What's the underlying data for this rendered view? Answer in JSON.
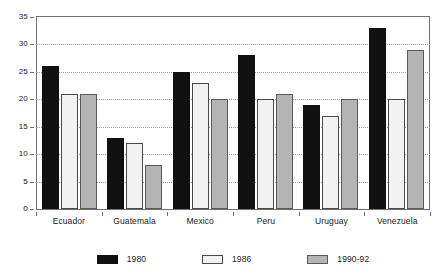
{
  "chart_data": {
    "type": "bar",
    "title": "",
    "subtitle": "",
    "xlabel": "",
    "ylabel": "",
    "ylim": [
      0,
      35
    ],
    "ytick_labels": [
      "0",
      "5",
      "10",
      "15",
      "20",
      "25",
      "30",
      "35"
    ],
    "yticks": [
      0,
      5,
      10,
      15,
      20,
      25,
      30,
      35
    ],
    "grid": true,
    "grid_axis": "y",
    "legend_position": "bottom",
    "categories": [
      "Ecuador",
      "Guatemala",
      "Mexico",
      "Peru",
      "Uruguay",
      "Venezuela"
    ],
    "series": [
      {
        "name": "1980",
        "color": "#111111",
        "values": [
          26,
          13,
          25,
          28,
          19,
          33
        ]
      },
      {
        "name": "1986",
        "color": "#f2f2f2",
        "values": [
          21,
          12,
          23,
          20,
          17,
          20
        ]
      },
      {
        "name": "1990-92",
        "color": "#b4b4b4",
        "values": [
          21,
          8,
          20,
          21,
          20,
          29
        ]
      }
    ]
  },
  "legend": {
    "items": [
      {
        "label": "1980"
      },
      {
        "label": "1986"
      },
      {
        "label": "1990-92"
      }
    ]
  },
  "colors": {
    "series_1980": "#111111",
    "series_1986": "#f2f2f2",
    "series_1990_92": "#b4b4b4",
    "axis": "#6f6f6f",
    "grid": "#9a9a9a",
    "text": "#1a1a1a",
    "background": "#ffffff"
  }
}
